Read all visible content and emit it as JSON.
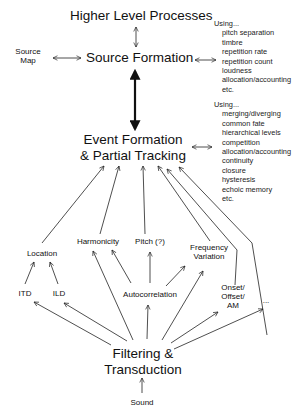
{
  "diagram": {
    "nodes": {
      "higher_level": "Higher Level Processes",
      "source_formation": "Source Formation",
      "source_map_line1": "Source",
      "source_map_line2": "Map",
      "event_formation_line1": "Event Formation",
      "event_formation_line2": "& Partial Tracking",
      "location": "Location",
      "harmonicity": "Harmonicity",
      "pitch": "Pitch (?)",
      "frequency_variation_line1": "Frequency",
      "frequency_variation_line2": "Variation",
      "itd": "ITD",
      "ild": "ILD",
      "autocorrelation": "Autocorrelation",
      "onset_line1": "Onset/",
      "onset_line2": "Offset/",
      "onset_line3": "AM",
      "ellipsis": "...",
      "filtering_line1": "Filtering &",
      "filtering_line2": "Transduction",
      "sound": "Sound"
    },
    "source_cues": {
      "heading": "Using...",
      "items": [
        "pitch separation",
        "timbre",
        "repetition rate",
        "repetition count",
        "loudness",
        "allocation/accounting",
        "etc."
      ]
    },
    "event_cues": {
      "heading": "Using...",
      "items": [
        "merging/diverging",
        "common fate",
        "hierarchical levels",
        "competition",
        "allocation/accounting",
        "continuity",
        "closure",
        "hysteresis",
        "echoic memory",
        "etc."
      ]
    },
    "colors": {
      "line": "#222222",
      "text": "#111111",
      "background": "#ffffff"
    }
  }
}
